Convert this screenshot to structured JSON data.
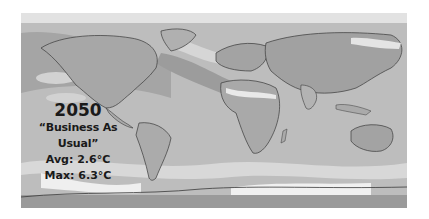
{
  "figure": {
    "type": "world-temperature-anomaly-map",
    "colormap": "grayscale",
    "colors": {
      "background": "#ffffff",
      "ocean_mid": "#bdbdbd",
      "warm_dark": "#8f8f8f",
      "cool_light": "#e6e6e6",
      "coastline": "#3a3a3a",
      "text": "#1a1a1a"
    }
  },
  "caption": {
    "year": "2050",
    "scenario": "“Business As Usual”",
    "avg": "Avg: 2.6°C",
    "max": "Max: 6.3°C"
  }
}
